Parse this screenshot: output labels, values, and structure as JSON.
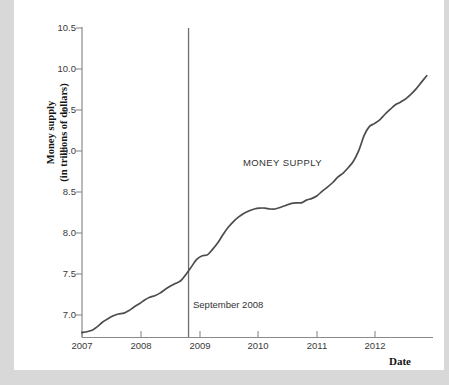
{
  "figure": {
    "background_color": "#ffffff",
    "page_color": "#d8d8d8",
    "line_color": "#4d4d4d",
    "axis_color": "#808080",
    "event_line_color": "#6e6e6e"
  },
  "axes": {
    "ylabel_line1": "Money supply",
    "ylabel_line2": "(in trillions of dollars)",
    "xlabel": "Date"
  },
  "annotations": {
    "series_label": "MONEY SUPPLY",
    "event_label": "September 2008"
  },
  "chart_data": {
    "type": "line",
    "title": "",
    "xlabel": "Date",
    "ylabel": "Money supply (in trillions of dollars)",
    "xlim": [
      2007.0,
      2012.6
    ],
    "ylim": [
      7.0,
      10.5
    ],
    "xticks": [
      2007,
      2008,
      2009,
      2010,
      2011,
      2012
    ],
    "xtick_labels": [
      "2007",
      "2008",
      "2009",
      "2010",
      "2011",
      "2012"
    ],
    "yticks": [
      7.0,
      7.5,
      8.0,
      8.5,
      9.0,
      9.5,
      10.0,
      10.5
    ],
    "ytick_labels": [
      "7.0",
      "7.5",
      "8.0",
      "8.5",
      "9.0",
      "9.5",
      "10.0",
      "10.5"
    ],
    "grid": false,
    "legend": null,
    "series": [
      {
        "name": "MONEY SUPPLY",
        "x": [
          2007.0,
          2007.08,
          2007.17,
          2007.25,
          2007.33,
          2007.42,
          2007.5,
          2007.58,
          2007.67,
          2007.75,
          2007.83,
          2007.92,
          2008.0,
          2008.08,
          2008.17,
          2008.25,
          2008.33,
          2008.42,
          2008.5,
          2008.58,
          2008.67,
          2008.75,
          2008.83,
          2008.92,
          2009.0,
          2009.08,
          2009.17,
          2009.25,
          2009.33,
          2009.42,
          2009.5,
          2009.58,
          2009.67,
          2009.75,
          2009.83,
          2009.92,
          2010.0,
          2010.08,
          2010.17,
          2010.25,
          2010.33,
          2010.42,
          2010.5,
          2010.58,
          2010.67,
          2010.75,
          2010.83,
          2010.92,
          2011.0,
          2011.08,
          2011.17,
          2011.25,
          2011.33,
          2011.42,
          2011.5,
          2011.58,
          2011.67,
          2011.75,
          2011.83,
          2011.92,
          2012.0,
          2012.08,
          2012.17,
          2012.25,
          2012.33,
          2012.42,
          2012.5
        ],
        "y": [
          7.05,
          7.06,
          7.08,
          7.12,
          7.17,
          7.21,
          7.24,
          7.26,
          7.27,
          7.3,
          7.34,
          7.38,
          7.42,
          7.45,
          7.47,
          7.5,
          7.54,
          7.58,
          7.61,
          7.64,
          7.72,
          7.8,
          7.88,
          7.92,
          7.93,
          7.99,
          8.07,
          8.16,
          8.24,
          8.31,
          8.36,
          8.4,
          8.43,
          8.45,
          8.46,
          8.46,
          8.45,
          8.45,
          8.47,
          8.49,
          8.51,
          8.52,
          8.52,
          8.55,
          8.57,
          8.6,
          8.65,
          8.7,
          8.75,
          8.81,
          8.86,
          8.92,
          8.99,
          9.12,
          9.28,
          9.38,
          9.42,
          9.46,
          9.52,
          9.58,
          9.63,
          9.66,
          9.7,
          9.75,
          9.81,
          9.89,
          9.96
        ]
      }
    ],
    "event_marker": {
      "label": "September 2008",
      "x": 2008.7,
      "y_top": 10.5,
      "y_bottom": 7.0
    }
  }
}
